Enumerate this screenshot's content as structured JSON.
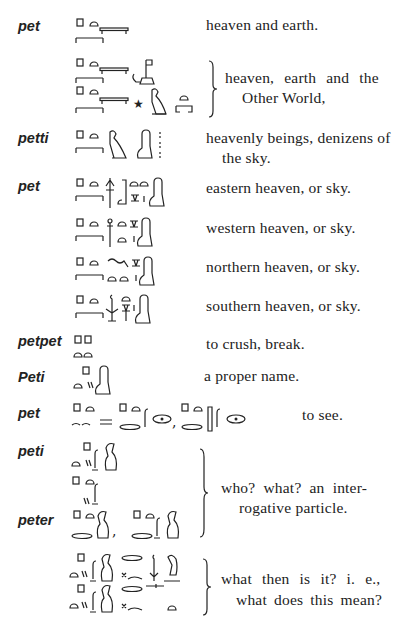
{
  "page": {
    "type": "dictionary-page",
    "language": "Egyptian hieroglyphic"
  },
  "entries": [
    {
      "lemma": "pet",
      "definition": "heaven and earth."
    },
    {
      "lemma": "",
      "definition_line1": "heaven, earth and the",
      "definition_line2": "Other World,"
    },
    {
      "lemma": "petti",
      "definition_line1": "heavenly beings, denizens of",
      "definition_line2": "the sky."
    },
    {
      "lemma": "pet",
      "definition": "eastern heaven, or sky."
    },
    {
      "lemma": "",
      "definition": "western heaven, or sky."
    },
    {
      "lemma": "",
      "definition": "northern heaven, or sky."
    },
    {
      "lemma": "",
      "definition": "southern heaven, or sky."
    },
    {
      "lemma": "petpet",
      "definition": "to crush, break."
    },
    {
      "lemma": "Peti",
      "definition": "a proper name."
    },
    {
      "lemma": "pet",
      "definition": "to see.",
      "separator": "=",
      "comma": ","
    },
    {
      "lemma": "peti",
      "definition_line1": "who? what? an inter-",
      "definition_line2": "rogative particle."
    },
    {
      "lemma": "peter",
      "comma": ","
    },
    {
      "lemma": "",
      "definition_line1": "what then is it? i. e.,",
      "definition_line2": "what does this mean?"
    }
  ]
}
